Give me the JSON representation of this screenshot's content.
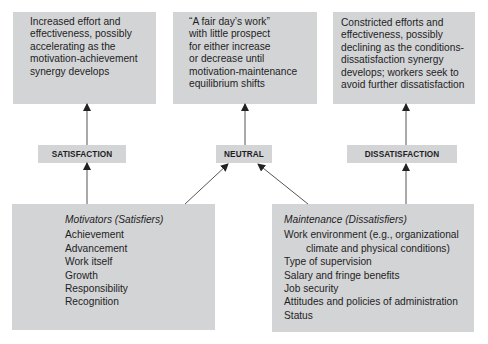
{
  "outcomes": {
    "satisfaction": [
      "Increased effort and",
      "effectiveness, possibly",
      "accelerating as the",
      "motivation-achievement",
      "synergy develops"
    ],
    "neutral": [
      "“A fair day’s work”",
      "with little prospect",
      "for either increase",
      "or decrease until",
      "motivation-maintenance",
      "equilibrium shifts"
    ],
    "dissatisfaction": [
      "Constricted efforts and",
      "effectiveness, possibly",
      "declining as the conditions-",
      "dissatisfaction synergy",
      "develops; workers seek to",
      "avoid further dissatisfaction"
    ]
  },
  "states": {
    "satisfaction": "SATISFACTION",
    "neutral": "NEUTRAL",
    "dissatisfaction": "DISSATISFACTION"
  },
  "factors": {
    "motivators": {
      "heading": "Motivators (Satisfiers)",
      "items": [
        "Achievement",
        "Advancement",
        "Work itself",
        "Growth",
        "Responsibility",
        "Recognition"
      ]
    },
    "maintenance": {
      "heading": "Maintenance (Dissatisfiers)",
      "items": [
        "Work environment (e.g., organizational",
        "climate and physical conditions)",
        "Type of supervision",
        "Salary and fringe benefits",
        "Job security",
        "Attitudes and policies of administration",
        "Status"
      ]
    }
  },
  "colors": {
    "box_fill": "#d3d4d6",
    "text": "#1e1e1e",
    "arrow": "#222222"
  }
}
